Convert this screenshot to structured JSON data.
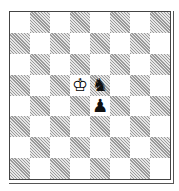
{
  "board": {
    "orientation": "white-bottom",
    "files": [
      "a",
      "b",
      "c",
      "d",
      "e",
      "f",
      "g",
      "h"
    ],
    "ranks": [
      8,
      7,
      6,
      5,
      4,
      3,
      2,
      1
    ],
    "top_left_square_color": "light",
    "pieces": [
      {
        "square": "d5",
        "piece": "white-king",
        "glyph": "♔"
      },
      {
        "square": "e5",
        "piece": "black-knight",
        "glyph": "♞"
      },
      {
        "square": "e4",
        "piece": "black-pawn",
        "glyph": "♟"
      }
    ]
  },
  "colors": {
    "light_square": "#ffffff",
    "dark_square_hatch": "#9a9a9a",
    "border": "#444444"
  }
}
